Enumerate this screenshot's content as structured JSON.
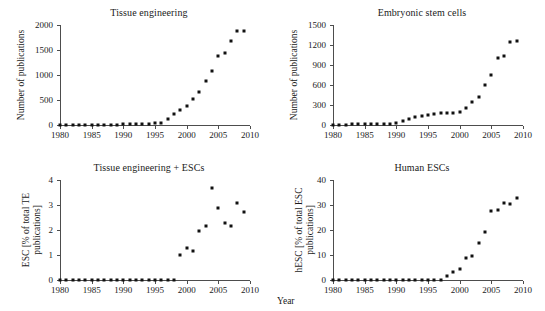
{
  "figure": {
    "x_axis_label": "Year",
    "dot_color": "#111111",
    "axis_color": "#4d4d4d",
    "background": "#ffffff"
  },
  "chart_data": [
    {
      "type": "scatter",
      "title": "Tissue engineering",
      "xlabel": "",
      "ylabel": "Number of publications",
      "xlim": [
        1980,
        2010
      ],
      "ylim": [
        0,
        2000
      ],
      "xticks": [
        1980,
        1985,
        1990,
        1995,
        2000,
        2005,
        2010
      ],
      "yticks": [
        0,
        500,
        1000,
        1500,
        2000
      ],
      "grid": false,
      "legend": "none",
      "x": [
        1980,
        1981,
        1982,
        1983,
        1984,
        1985,
        1986,
        1987,
        1988,
        1989,
        1990,
        1991,
        1992,
        1993,
        1994,
        1995,
        1996,
        1997,
        1998,
        1999,
        2000,
        2001,
        2002,
        2003,
        2004,
        2005,
        2006,
        2007,
        2008,
        2009
      ],
      "values": [
        2,
        3,
        3,
        4,
        5,
        5,
        6,
        7,
        8,
        9,
        11,
        13,
        16,
        20,
        26,
        35,
        48,
        130,
        230,
        310,
        380,
        520,
        670,
        880,
        1090,
        1390,
        1450,
        1690,
        1880,
        1890
      ]
    },
    {
      "type": "scatter",
      "title": "Embryonic stem cells",
      "xlabel": "",
      "ylabel": "Number of publications",
      "xlim": [
        1980,
        2010
      ],
      "ylim": [
        0,
        1500
      ],
      "xticks": [
        1980,
        1985,
        1990,
        1995,
        2000,
        2005,
        2010
      ],
      "yticks": [
        0,
        300,
        600,
        900,
        1200,
        1500
      ],
      "grid": false,
      "legend": "none",
      "x": [
        1980,
        1981,
        1982,
        1983,
        1984,
        1985,
        1986,
        1987,
        1988,
        1989,
        1990,
        1991,
        1992,
        1993,
        1994,
        1995,
        1996,
        1997,
        1998,
        1999,
        2000,
        2001,
        2002,
        2003,
        2004,
        2005,
        2006,
        2007,
        2008,
        2009
      ],
      "values": [
        5,
        6,
        7,
        8,
        9,
        10,
        12,
        14,
        16,
        20,
        30,
        60,
        95,
        120,
        140,
        150,
        160,
        175,
        180,
        175,
        200,
        250,
        345,
        420,
        605,
        755,
        1005,
        1030,
        1250,
        1255
      ]
    },
    {
      "type": "scatter",
      "title": "Tissue engineering + ESCs",
      "xlabel": "",
      "ylabel": "ESC [% of total TE publications]",
      "xlim": [
        1980,
        2010
      ],
      "ylim": [
        0,
        4
      ],
      "xticks": [
        1980,
        1985,
        1990,
        1995,
        2000,
        2005,
        2010
      ],
      "yticks": [
        0,
        1,
        2,
        3,
        4
      ],
      "grid": false,
      "legend": "none",
      "x": [
        1980,
        1981,
        1982,
        1983,
        1984,
        1985,
        1986,
        1987,
        1988,
        1989,
        1990,
        1991,
        1992,
        1993,
        1994,
        1995,
        1996,
        1997,
        1998,
        1999,
        2000,
        2001,
        2002,
        2003,
        2004,
        2005,
        2006,
        2007,
        2008,
        2009
      ],
      "values": [
        0,
        0,
        0,
        0,
        0,
        0,
        0,
        0,
        0,
        0,
        0,
        0,
        0,
        0,
        0,
        0,
        0,
        0,
        0,
        1.0,
        1.3,
        1.15,
        1.97,
        2.15,
        3.67,
        2.87,
        2.27,
        2.18,
        3.08,
        2.73
      ]
    },
    {
      "type": "scatter",
      "title": "Human ESCs",
      "xlabel": "Year",
      "ylabel": "hESC [% of total ESC publications]",
      "xlim": [
        1980,
        2010
      ],
      "ylim": [
        0,
        40
      ],
      "xticks": [
        1980,
        1985,
        1990,
        1995,
        2000,
        2005,
        2010
      ],
      "yticks": [
        0,
        10,
        20,
        30,
        40
      ],
      "grid": false,
      "legend": "none",
      "x": [
        1980,
        1981,
        1982,
        1983,
        1984,
        1985,
        1986,
        1987,
        1988,
        1989,
        1990,
        1991,
        1992,
        1993,
        1994,
        1995,
        1996,
        1997,
        1998,
        1999,
        2000,
        2001,
        2002,
        2003,
        2004,
        2005,
        2006,
        2007,
        2008,
        2009
      ],
      "values": [
        0,
        0,
        0,
        0,
        0,
        0,
        0,
        0,
        0,
        0,
        0,
        0,
        0,
        0,
        0,
        0,
        0,
        0,
        1.6,
        3.3,
        4.4,
        9.0,
        9.5,
        15.0,
        19.1,
        27.6,
        28.0,
        30.8,
        30.5,
        33.0
      ]
    }
  ]
}
